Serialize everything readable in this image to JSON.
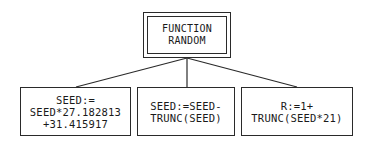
{
  "diagram": {
    "type": "tree",
    "root": {
      "lines": [
        "FUNCTION",
        "RANDOM"
      ],
      "border": "double"
    },
    "children": [
      {
        "lines": [
          "SEED:=",
          "SEED*27.182813",
          "+31.415917"
        ]
      },
      {
        "lines": [
          "SEED:=SEED-",
          "TRUNC(SEED)"
        ]
      },
      {
        "lines": [
          "R:=1+",
          "TRUNC(SEED*21)"
        ]
      }
    ],
    "colors": {
      "line": "#2a2a2a",
      "background": "#ffffff"
    }
  }
}
